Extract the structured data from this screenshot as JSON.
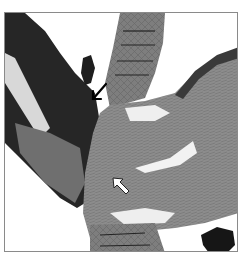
{
  "figure": {
    "type": "histology-micrograph",
    "colormode": "grayscale",
    "annotations": [
      {
        "kind": "arrow",
        "style": "solid-black",
        "direction": "down-left"
      },
      {
        "kind": "arrow",
        "style": "white-outlined",
        "direction": "up-left"
      }
    ],
    "colors": {
      "background": "#ffffff",
      "frame": "#8a8a8a",
      "tissue_dark": "#2a2a2a",
      "tissue_mid": "#7a7a7a",
      "tissue_light": "#a8a8a8"
    }
  }
}
